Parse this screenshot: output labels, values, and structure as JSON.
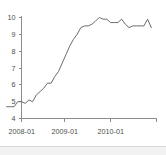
{
  "chart_data": {
    "type": "line",
    "title": "",
    "subtitle": "",
    "xlabel": "",
    "ylabel": "",
    "grid": false,
    "legend": null,
    "legend_position": "none",
    "line_color": "#6b6b6b",
    "axis_color": "#8c8c8c",
    "background_color": "#ffffff",
    "ylim": [
      4,
      10
    ],
    "yticks": [
      4,
      5,
      6,
      7,
      8,
      9,
      10
    ],
    "ytick_labels": [
      "4",
      "5",
      "6",
      "7",
      "8",
      "9",
      "10"
    ],
    "xtick_labels": [
      "2008-01",
      "2009-01",
      "2010-01"
    ],
    "xtick_values": [
      "2008-01",
      "2009-01",
      "2010-01"
    ],
    "xlim": [
      "2007-09",
      "2010-12"
    ],
    "x": [
      "2007-09",
      "2007-10",
      "2007-11",
      "2007-12",
      "2008-01",
      "2008-02",
      "2008-03",
      "2008-04",
      "2008-05",
      "2008-06",
      "2008-07",
      "2008-08",
      "2008-09",
      "2008-10",
      "2008-11",
      "2008-12",
      "2009-01",
      "2009-02",
      "2009-03",
      "2009-04",
      "2009-05",
      "2009-06",
      "2009-07",
      "2009-08",
      "2009-09",
      "2009-10",
      "2009-11",
      "2009-12",
      "2010-01",
      "2010-02",
      "2010-03",
      "2010-04",
      "2010-05",
      "2010-06",
      "2010-07",
      "2010-08",
      "2010-09",
      "2010-10",
      "2010-11",
      "2010-12"
    ],
    "values": [
      4.7,
      4.7,
      4.7,
      5.0,
      5.0,
      4.9,
      5.1,
      5.0,
      5.4,
      5.6,
      5.8,
      6.1,
      6.1,
      6.5,
      6.8,
      7.3,
      7.8,
      8.3,
      8.7,
      9.0,
      9.4,
      9.5,
      9.5,
      9.6,
      9.8,
      10.0,
      9.9,
      9.9,
      9.7,
      9.7,
      9.7,
      9.9,
      9.6,
      9.4,
      9.5,
      9.5,
      9.5,
      9.5,
      9.9,
      9.4
    ],
    "series": [
      {
        "name": "rate",
        "values": [
          4.7,
          4.7,
          4.7,
          5.0,
          5.0,
          4.9,
          5.1,
          5.0,
          5.4,
          5.6,
          5.8,
          6.1,
          6.1,
          6.5,
          6.8,
          7.3,
          7.8,
          8.3,
          8.7,
          9.0,
          9.4,
          9.5,
          9.5,
          9.6,
          9.8,
          10.0,
          9.9,
          9.9,
          9.7,
          9.7,
          9.7,
          9.9,
          9.6,
          9.4,
          9.5,
          9.5,
          9.5,
          9.5,
          9.9,
          9.4
        ]
      }
    ]
  }
}
